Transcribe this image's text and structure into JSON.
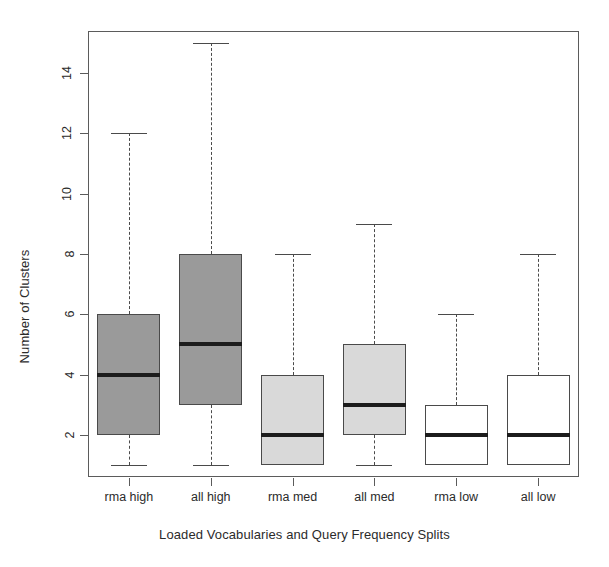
{
  "chart_data": {
    "type": "box",
    "title": "",
    "xlabel": "Loaded Vocabularies and Query Frequency Splits",
    "ylabel": "Number of Clusters",
    "categories": [
      "rma high",
      "all high",
      "rma med",
      "all med",
      "rma low",
      "all low"
    ],
    "yticks": [
      2,
      4,
      6,
      8,
      10,
      12,
      14
    ],
    "ytick_labels": [
      "2",
      "4",
      "6",
      "8",
      "10",
      "12",
      "14"
    ],
    "ylim": [
      0.6,
      15.4
    ],
    "grid": false,
    "legend": null,
    "boxes": [
      {
        "category": "rma high",
        "whisker_low": 1,
        "q1": 2,
        "median": 4,
        "q3": 6,
        "whisker_high": 12,
        "fill": "#9a9a9a"
      },
      {
        "category": "all high",
        "whisker_low": 1,
        "q1": 3,
        "median": 5,
        "q3": 8,
        "whisker_high": 15,
        "fill": "#9a9a9a"
      },
      {
        "category": "rma med",
        "whisker_low": 1,
        "q1": 1,
        "median": 2,
        "q3": 4,
        "whisker_high": 8,
        "fill": "#d9d9d9"
      },
      {
        "category": "all med",
        "whisker_low": 1,
        "q1": 2,
        "median": 3,
        "q3": 5,
        "whisker_high": 9,
        "fill": "#d9d9d9"
      },
      {
        "category": "rma low",
        "whisker_low": 1,
        "q1": 1,
        "median": 2,
        "q3": 3,
        "whisker_high": 6,
        "fill": "#ffffff"
      },
      {
        "category": "all low",
        "whisker_low": 1,
        "q1": 1,
        "median": 2,
        "q3": 4,
        "whisker_high": 8,
        "fill": "#ffffff"
      }
    ],
    "colors": {
      "axis": "#5b5b5b",
      "box_border": "#4a4a4a",
      "median": "#1c1c1c",
      "background": "#ffffff",
      "fill_dark": "#9a9a9a",
      "fill_light": "#d9d9d9",
      "fill_empty": "#ffffff"
    }
  }
}
